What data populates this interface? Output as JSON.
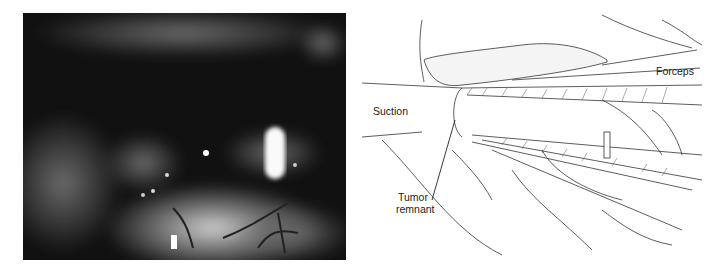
{
  "figure": {
    "left_panel": {
      "type": "intraoperative-photograph",
      "tone": "grayscale"
    },
    "right_panel": {
      "type": "surgical-illustration",
      "labels": {
        "forceps": "Forceps",
        "suction": "Suction",
        "tumor_line1": "Tumor",
        "tumor_line2": "remnant"
      }
    }
  }
}
